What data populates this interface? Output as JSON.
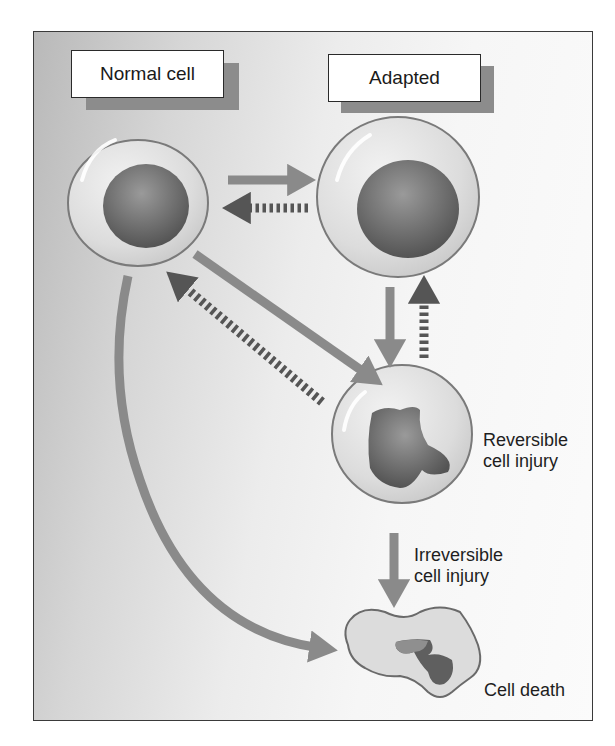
{
  "labels": {
    "normal_cell": "Normal cell",
    "adapted": "Adapted",
    "reversible_line1": "Reversible",
    "reversible_line2": "cell injury",
    "irreversible_line1": "Irreversible",
    "irreversible_line2": "cell injury",
    "cell_death": "Cell death"
  },
  "nodes": [
    {
      "id": "normal",
      "label": "Normal cell"
    },
    {
      "id": "adapted",
      "label": "Adapted"
    },
    {
      "id": "reversible",
      "label": "Reversible cell injury"
    },
    {
      "id": "death",
      "label": "Cell death"
    }
  ],
  "edges": [
    {
      "from": "normal",
      "to": "adapted",
      "style": "solid"
    },
    {
      "from": "adapted",
      "to": "normal",
      "style": "dashed"
    },
    {
      "from": "adapted",
      "to": "reversible",
      "style": "solid"
    },
    {
      "from": "reversible",
      "to": "adapted",
      "style": "dashed"
    },
    {
      "from": "normal",
      "to": "reversible",
      "style": "solid"
    },
    {
      "from": "reversible",
      "to": "normal",
      "style": "dashed"
    },
    {
      "from": "reversible",
      "to": "death",
      "style": "solid",
      "label": "Irreversible cell injury"
    },
    {
      "from": "normal",
      "to": "death",
      "style": "solid-curved"
    }
  ],
  "colors": {
    "solid_arrow": "#8a8a8a",
    "dashed_arrow": "#555555",
    "cell_outline": "#7a7a7a",
    "nucleus": "#6e6e6e"
  }
}
